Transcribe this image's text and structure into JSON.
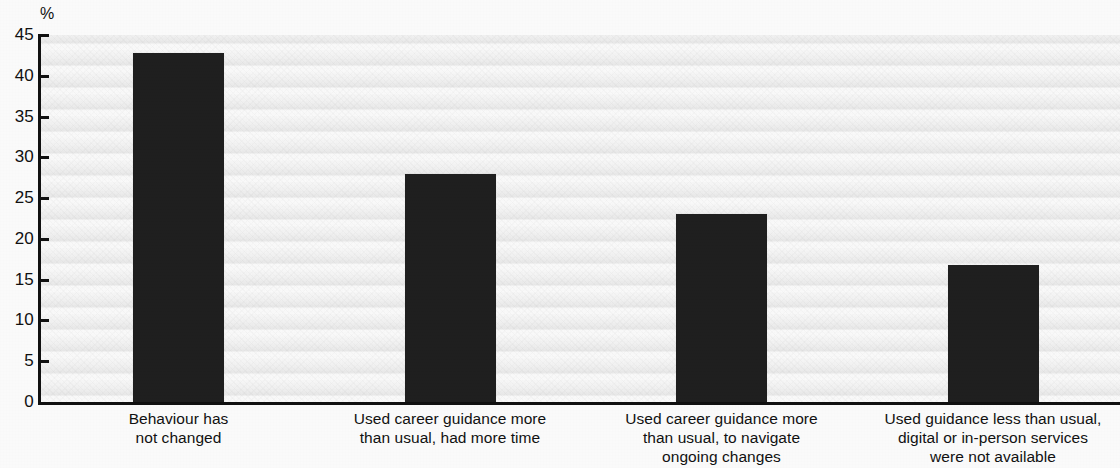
{
  "chart_data": {
    "type": "bar",
    "title": "",
    "subtitle": "",
    "xlabel": "",
    "ylabel": "",
    "unit_label": "%",
    "ylim": [
      0,
      45
    ],
    "yticks": [
      0,
      5,
      10,
      15,
      20,
      25,
      30,
      35,
      40,
      45
    ],
    "ytick_labels": [
      "0",
      "5",
      "10",
      "15",
      "20",
      "25",
      "30",
      "35",
      "40",
      "45"
    ],
    "grid": false,
    "legend": null,
    "bar_color": "#1f1f1f",
    "background_color": "#f2f2f2",
    "categories": [
      "Behaviour has not changed",
      "Used career guidance more than usual, had more time",
      "Used career guidance more than usual, to navigate ongoing changes",
      "Used guidance less than usual, digital or in-person services were not available"
    ],
    "category_lines": [
      [
        "Behaviour has",
        "not changed"
      ],
      [
        "Used career guidance more",
        "than usual, had more time"
      ],
      [
        "Used career guidance more",
        "than usual, to navigate",
        "ongoing changes"
      ],
      [
        "Used guidance less than usual,",
        "digital or in-person services",
        "were not available"
      ]
    ],
    "values": [
      42.8,
      28.0,
      23.1,
      16.8
    ]
  }
}
